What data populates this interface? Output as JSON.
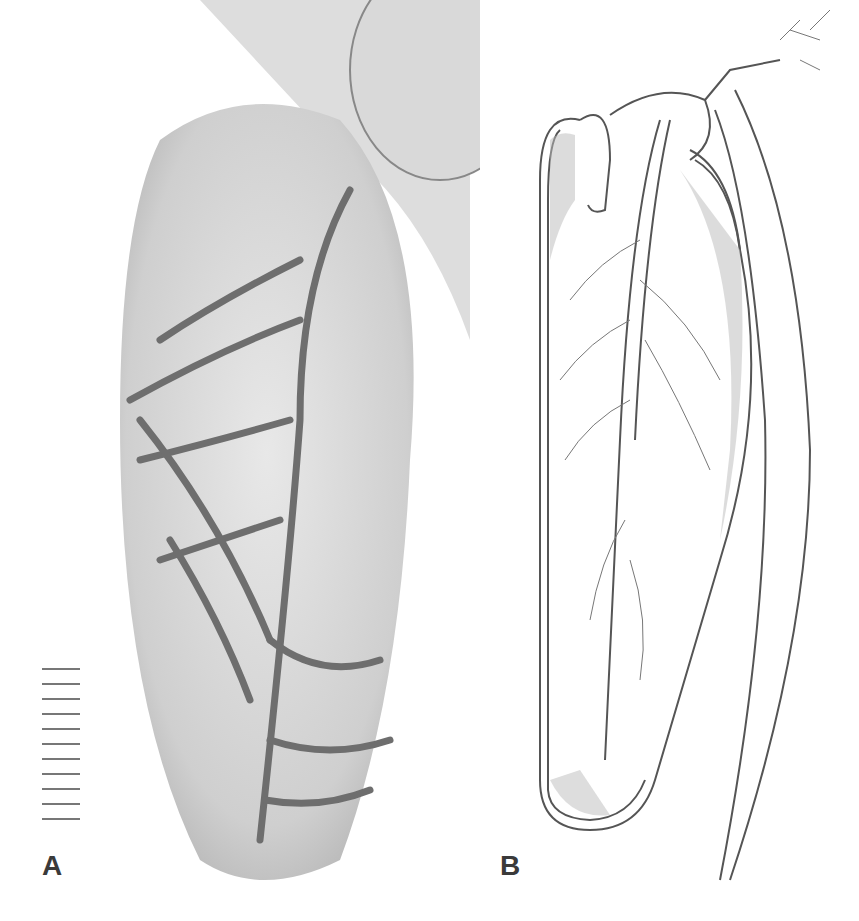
{
  "figure": {
    "panels": [
      {
        "id": "A",
        "label": "A",
        "type": "photograph",
        "description": "grayscale photo of translucent elongated organ with branching vessels"
      },
      {
        "id": "B",
        "label": "B",
        "type": "line-drawing",
        "description": "stippled illustration of same organ with branching vessels"
      }
    ],
    "scale_bar": {
      "ticks": 11
    }
  }
}
